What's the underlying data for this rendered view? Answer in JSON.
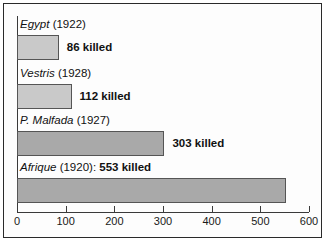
{
  "chart_data": {
    "type": "bar",
    "orientation": "horizontal",
    "title": "",
    "xlabel": "",
    "ylabel": "",
    "xlim": [
      0,
      600
    ],
    "grid": false,
    "legend": null,
    "tick_labels": [
      "0",
      "100",
      "200",
      "300",
      "400",
      "500",
      "600"
    ],
    "tick_values": [
      0,
      100,
      200,
      300,
      400,
      500,
      600
    ],
    "categories": [
      "Egypt (1922)",
      "Vestris (1928)",
      "P. Malfada (1927)",
      "Afrique (1920)"
    ],
    "values": [
      86,
      112,
      303,
      553
    ],
    "data_labels": [
      "86 killed",
      "112 killed",
      "303 killed",
      "553 killed"
    ],
    "bars": [
      {
        "ship": "Egypt",
        "year": "(1922)",
        "label_separator": "",
        "value": 86,
        "value_label": "86 killed",
        "value_inline": false,
        "color": "#c9c9c9"
      },
      {
        "ship": "Vestris",
        "year": "(1928)",
        "label_separator": "",
        "value": 112,
        "value_label": "112 killed",
        "value_inline": false,
        "color": "#c9c9c9"
      },
      {
        "ship": "P. Malfada",
        "year": "(1927)",
        "label_separator": "",
        "value": 303,
        "value_label": "303 killed",
        "value_inline": false,
        "color": "#a9a9a9"
      },
      {
        "ship": "Afrique",
        "year": "(1920)",
        "label_separator": ":",
        "value": 553,
        "value_label": "553 killed",
        "value_inline": true,
        "color": "#a9a9a9"
      }
    ]
  },
  "axis": {
    "ticks": [
      {
        "label": "0",
        "value": 0
      },
      {
        "label": "100",
        "value": 100
      },
      {
        "label": "200",
        "value": 200
      },
      {
        "label": "300",
        "value": 300
      },
      {
        "label": "400",
        "value": 400
      },
      {
        "label": "500",
        "value": 500
      },
      {
        "label": "600",
        "value": 600
      }
    ]
  },
  "colors": {
    "bar_light": "#c9c9c9",
    "bar_dark": "#a9a9a9",
    "bar_outline": "#555555",
    "axis": "#3a3a3a",
    "text": "#111111",
    "border": "#2a2a2a",
    "background": "#fdfdfd"
  }
}
